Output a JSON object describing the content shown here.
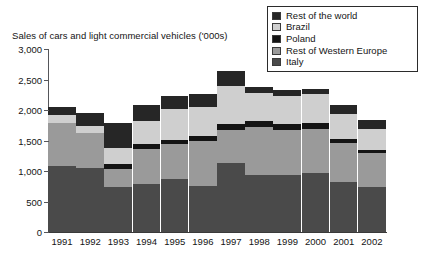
{
  "chart_data": {
    "type": "bar",
    "stacked": true,
    "title": "Sales of cars and light commercial vehicles ('000s)",
    "xlabel": "",
    "ylabel": "",
    "ylim": [
      0,
      3000
    ],
    "ytick_step": 500,
    "ytick_labels": [
      "0",
      "500",
      "1,000",
      "1,500",
      "2,000",
      "2,500",
      "3,000"
    ],
    "ytick_values": [
      0,
      500,
      1000,
      1500,
      2000,
      2500,
      3000
    ],
    "grid": false,
    "legend_position": "top-right",
    "categories": [
      "1991",
      "1992",
      "1993",
      "1994",
      "1995",
      "1996",
      "1997",
      "1998",
      "1999",
      "2000",
      "2001",
      "2002"
    ],
    "series": [
      {
        "name": "Italy",
        "color": "#4a4a4a",
        "values": [
          1080,
          1050,
          740,
          790,
          870,
          760,
          1135,
          940,
          935,
          960,
          820,
          730
        ]
      },
      {
        "name": "Rest of Western Europe",
        "color": "#9a9a9a",
        "values": [
          700,
          570,
          300,
          570,
          570,
          730,
          530,
          775,
          735,
          725,
          640,
          560
        ]
      },
      {
        "name": "Poland",
        "color": "#141414",
        "values": [
          0,
          0,
          80,
          85,
          75,
          85,
          105,
          105,
          100,
          100,
          60,
          50
        ]
      },
      {
        "name": "Brazil",
        "color": "#cfcfcf",
        "values": [
          145,
          110,
          260,
          380,
          500,
          480,
          630,
          455,
          460,
          470,
          420,
          350
        ]
      },
      {
        "name": "Rest of the world",
        "color": "#262626",
        "values": [
          130,
          215,
          415,
          260,
          215,
          215,
          235,
          100,
          105,
          90,
          145,
          145
        ]
      }
    ],
    "legend_order": [
      "Rest of the world",
      "Brazil",
      "Poland",
      "Rest of Western Europe",
      "Italy"
    ],
    "totals": [
      2055,
      1945,
      1795,
      2085,
      2230,
      2270,
      2635,
      2375,
      2335,
      2345,
      2085,
      1835
    ]
  }
}
